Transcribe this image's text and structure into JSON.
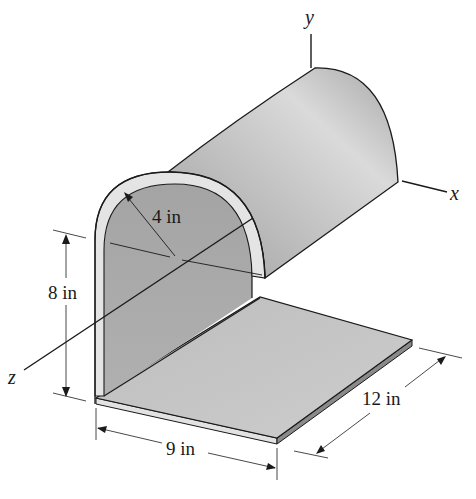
{
  "figure": {
    "axes": {
      "x_label": "x",
      "y_label": "y",
      "z_label": "z"
    },
    "dimensions": {
      "radius": "4 in",
      "height": "8 in",
      "width": "9 in",
      "depth": "12 in"
    },
    "colors": {
      "shell": "#b4b4b4",
      "shell_highlight": "#d8d8d8",
      "inner_wall": "#a8a8a8",
      "base_plate": "#c6c6c6",
      "edge_rim": "#e4e4e4",
      "outline": "#1a1a1a"
    }
  }
}
